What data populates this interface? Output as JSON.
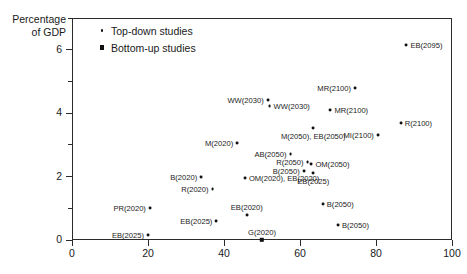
{
  "chart_data": {
    "type": "scatter",
    "title": "",
    "xlabel": "",
    "ylabel": "Percentage of GDP",
    "xlim": [
      0,
      100
    ],
    "ylim": [
      0,
      7
    ],
    "grid": false,
    "legend_position": "top-left-inside",
    "x_ticks": [
      0,
      20,
      40,
      60,
      80,
      100
    ],
    "x_tick_labels": [
      "0",
      "20",
      "40",
      "60",
      "80",
      "100"
    ],
    "y_ticks": [
      0,
      2,
      4,
      6
    ],
    "y_tick_labels": [
      "0",
      "2",
      "4",
      "6"
    ],
    "y_minor_ticks": [
      1,
      3,
      5,
      7
    ],
    "series": [
      {
        "name": "Top-down studies",
        "marker": "circle",
        "points": [
          {
            "label": "EB(2095)",
            "x": 88.0,
            "y": 6.15,
            "label_side": "right"
          },
          {
            "label": "MR(2100)",
            "x": 74.5,
            "y": 4.8,
            "label_side": "left"
          },
          {
            "label": "MR(2100)",
            "x": 68.0,
            "y": 4.1,
            "label_side": "right"
          },
          {
            "label": "R(2100)",
            "x": 86.5,
            "y": 3.7,
            "label_side": "right"
          },
          {
            "label": "WW(2030)",
            "x": 51.5,
            "y": 4.42,
            "label_side": "left"
          },
          {
            "label": "WW(2030)",
            "x": 52.0,
            "y": 4.22,
            "label_side": "right"
          },
          {
            "label": "M(2050), EB(2050)",
            "x": 63.5,
            "y": 3.52,
            "label_side": "below"
          },
          {
            "label": "MI(2100)",
            "x": 80.5,
            "y": 3.3,
            "label_side": "left"
          },
          {
            "label": "M(2020)",
            "x": 43.5,
            "y": 3.05,
            "label_side": "left"
          },
          {
            "label": "AB(2050)",
            "x": 57.5,
            "y": 2.72,
            "label_side": "left"
          },
          {
            "label": "R(2050)",
            "x": 62.0,
            "y": 2.45,
            "label_side": "left"
          },
          {
            "label": "OM(2050)",
            "x": 63.0,
            "y": 2.4,
            "label_side": "right"
          },
          {
            "label": "B(2050)",
            "x": 61.0,
            "y": 2.18,
            "label_side": "left"
          },
          {
            "label": "EB(2025)",
            "x": 63.5,
            "y": 2.12,
            "label_side": "below"
          },
          {
            "label": "B(2020)",
            "x": 34.0,
            "y": 1.98,
            "label_side": "left"
          },
          {
            "label": "OM(2020), EB(2020)",
            "x": 45.5,
            "y": 1.95,
            "label_side": "right"
          },
          {
            "label": "R(2020)",
            "x": 37.0,
            "y": 1.62,
            "label_side": "left"
          },
          {
            "label": "B(2050)",
            "x": 66.0,
            "y": 1.12,
            "label_side": "right"
          },
          {
            "label": "PR(2020)",
            "x": 20.5,
            "y": 1.0,
            "label_side": "left"
          },
          {
            "label": "EB(2020)",
            "x": 46.0,
            "y": 0.78,
            "label_side": "above"
          },
          {
            "label": "EB(2025)",
            "x": 38.0,
            "y": 0.6,
            "label_side": "left"
          },
          {
            "label": "B(2050)",
            "x": 70.0,
            "y": 0.48,
            "label_side": "right"
          },
          {
            "label": "EB(2025)",
            "x": 20.0,
            "y": 0.15,
            "label_side": "left"
          }
        ]
      },
      {
        "name": "Bottom-up studies",
        "marker": "square",
        "points": [
          {
            "label": "G(2020)",
            "x": 50.0,
            "y": 0.0,
            "label_side": "above"
          }
        ]
      }
    ]
  },
  "legend": {
    "entries": [
      {
        "label": "Top-down studies",
        "marker": "circle"
      },
      {
        "label": "Bottom-up studies",
        "marker": "square"
      }
    ]
  },
  "axes": {
    "y_title": "Percentage\nof GDP"
  },
  "colors": {
    "marker": "#111111",
    "axis": "#2b2b2b",
    "text": "#1a1a1a",
    "background": "#ffffff"
  }
}
